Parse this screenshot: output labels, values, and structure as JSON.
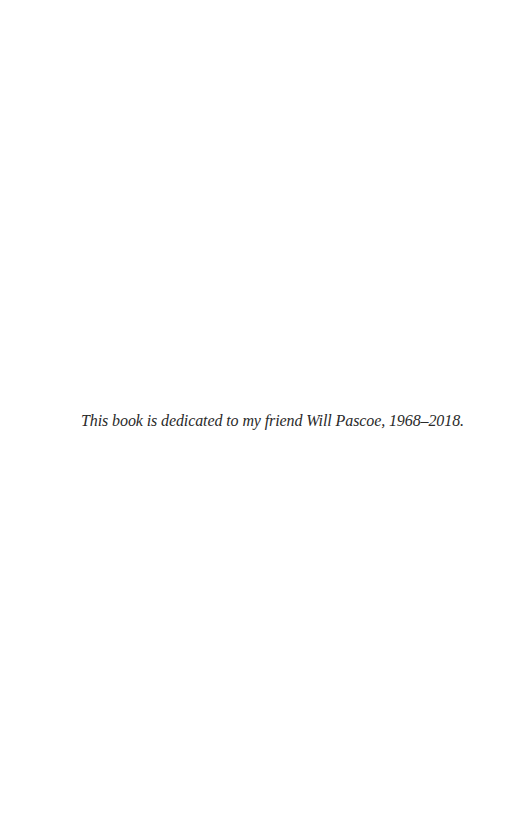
{
  "page": {
    "dedication": "This book is dedicated to my friend Will Pascoe, 1968–2018."
  }
}
